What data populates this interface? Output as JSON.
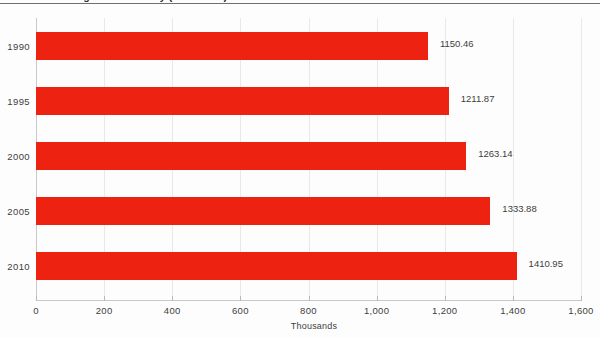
{
  "chart_data": {
    "type": "bar",
    "orientation": "horizontal",
    "title": "International Migrants in Turkey (1990-2010)",
    "categories": [
      "1990",
      "1995",
      "2000",
      "2005",
      "2010"
    ],
    "values": [
      1150.46,
      1211.87,
      1263.14,
      1333.88,
      1410.95
    ],
    "value_labels": [
      "1150.46",
      "1211.87",
      "1263.14",
      "1333.88",
      "1410.95"
    ],
    "series": [
      {
        "name": "International migrants",
        "values": [
          1150.46,
          1211.87,
          1263.14,
          1333.88,
          1410.95
        ],
        "color": "#ee2211"
      }
    ],
    "xlabel": "Thousands",
    "ylabel": "",
    "xlim": [
      0,
      1600
    ],
    "xticks": [
      0,
      200,
      400,
      600,
      800,
      1000,
      1200,
      1400,
      1600
    ],
    "xtick_labels": [
      "0",
      "200",
      "400",
      "600",
      "800",
      "1,000",
      "1,200",
      "1,400",
      "1,600"
    ],
    "grid": true,
    "grid_axis": "x",
    "legend": false,
    "legend_position": "none",
    "bar_color": "#ee2211",
    "axis_color": "#c9c9c9",
    "text_color": "#3d3d3d"
  }
}
